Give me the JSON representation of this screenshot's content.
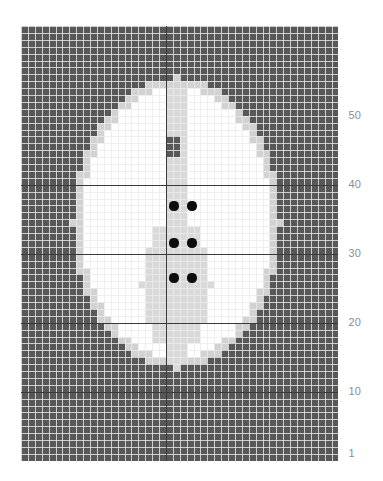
{
  "figure": {
    "title": "",
    "background_color": "#ffffff"
  },
  "axis": {
    "name": "y-axis",
    "orientation": "right",
    "tick_labels": [
      "50",
      "40",
      "30",
      "20",
      "10",
      "1"
    ],
    "tick_values": [
      50,
      40,
      30,
      20,
      10,
      1
    ],
    "label_color": "#8d8d8d",
    "range": [
      1,
      50
    ]
  },
  "chart_data": {
    "type": "heatmap",
    "title": "",
    "xlabel": "",
    "ylabel": "",
    "grid": true,
    "legend_position": "none",
    "ncols": 46,
    "nrows": 63,
    "cell_px": 6.9,
    "origin_px": [
      21,
      26
    ],
    "ylim": [
      1,
      50
    ],
    "xlim": [
      1,
      46
    ],
    "major_gridlines": {
      "rows": [
        10,
        20,
        30,
        40
      ],
      "cols": [
        22
      ]
    },
    "value_legend": [
      {
        "label": "background",
        "code": 0,
        "color": "#585858"
      },
      {
        "label": "skull/edge",
        "code": 1,
        "color": "#d2d2d2"
      },
      {
        "label": "parenchyma",
        "code": 2,
        "color": "#ffffff"
      },
      {
        "label": "ventricle/midline",
        "code": 3,
        "color": "#d9d9d9"
      },
      {
        "label": "marked voxel",
        "code": 4,
        "color": "#0d0d0d"
      }
    ],
    "markers": {
      "name": "marked-voxels",
      "count": 6,
      "color": "#0d0d0d",
      "radius_px": 4.6,
      "points": [
        {
          "col": 23,
          "row": 30,
          "x_px": 174,
          "y_px": 206
        },
        {
          "col": 26,
          "row": 30,
          "x_px": 192,
          "y_px": 206
        },
        {
          "col": 23,
          "row": 26,
          "x_px": 174,
          "y_px": 243
        },
        {
          "col": 26,
          "row": 26,
          "x_px": 192,
          "y_px": 243
        },
        {
          "col": 23,
          "row": 21,
          "x_px": 174,
          "y_px": 278
        },
        {
          "col": 26,
          "row": 21,
          "x_px": 192,
          "y_px": 278
        }
      ]
    },
    "ellipse_brain": {
      "center_col": 23.0,
      "center_row": 35.0,
      "radius_col": 15.0,
      "radius_row": 21.0
    },
    "midline_band": {
      "col_start": 22,
      "col_end": 24,
      "row_start": 8,
      "row_end": 54
    },
    "ventricle_block": {
      "col_start": 20,
      "col_end": 27,
      "row_start": 18,
      "row_end": 34
    }
  }
}
